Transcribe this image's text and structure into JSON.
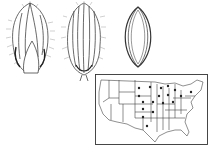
{
  "figure": {
    "panels": [
      {
        "id": "spikelet-front",
        "label": "spikelet, lower view"
      },
      {
        "id": "spikelet-back",
        "label": "spikelet, upper view"
      },
      {
        "id": "floret",
        "label": "fertile floret"
      },
      {
        "id": "distribution-map",
        "label": "US distribution map"
      }
    ],
    "map": {
      "dot_count": 18,
      "dots": [
        [
          98,
          20
        ],
        [
          97,
          25
        ],
        [
          110,
          19
        ],
        [
          120,
          21
        ],
        [
          126,
          19
        ],
        [
          118,
          28
        ],
        [
          126,
          26
        ],
        [
          103,
          33
        ],
        [
          113,
          33
        ],
        [
          122,
          33
        ],
        [
          134,
          30
        ],
        [
          102,
          38
        ],
        [
          110,
          40
        ],
        [
          104,
          46
        ],
        [
          112,
          47
        ],
        [
          103,
          55
        ],
        [
          113,
          40
        ],
        [
          140,
          30
        ]
      ]
    },
    "colors": {
      "ink": "#333333",
      "background": "#ffffff"
    }
  }
}
